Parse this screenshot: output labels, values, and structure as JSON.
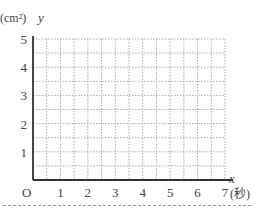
{
  "chart_data": {
    "type": "line",
    "title": "",
    "xlabel": "x (秒)",
    "ylabel": "y (cm²)",
    "x_var": "x",
    "y_var": "y",
    "x_unit": "(秒)",
    "y_unit": "(cm²)",
    "origin_label": "O",
    "x_ticks": [
      1,
      2,
      3,
      4,
      5,
      6,
      7
    ],
    "y_ticks": [
      1,
      2,
      3,
      4,
      5
    ],
    "xlim": [
      0,
      7
    ],
    "ylim": [
      0,
      5
    ],
    "grid": true,
    "grid_step": 0.5,
    "grid_style": "dotted",
    "series": []
  },
  "colors": {
    "axis": "#333333",
    "grid": "#aaaaaa",
    "text": "#444444"
  }
}
